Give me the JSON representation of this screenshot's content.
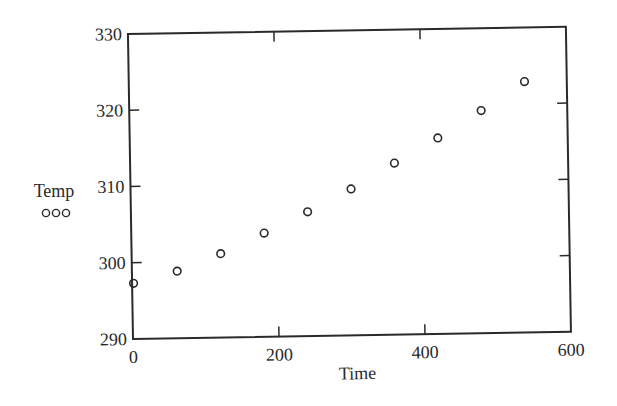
{
  "chart_data": {
    "type": "scatter",
    "title": "",
    "xlabel": "Time",
    "ylabel": "Temp",
    "xlim": [
      0,
      600
    ],
    "ylim": [
      290,
      330
    ],
    "xticks": [
      0,
      200,
      400,
      600
    ],
    "yticks": [
      290,
      300,
      310,
      320,
      330
    ],
    "xtick_labels": [
      "0",
      "200",
      "400",
      "600"
    ],
    "ytick_labels": [
      "290",
      "300",
      "310",
      "320",
      "330"
    ],
    "grid": false,
    "marker": "open-circle",
    "legend": {
      "label": "Temp",
      "marker_text": "ooo",
      "position": "left, under y-axis label"
    },
    "series": [
      {
        "name": "Temp",
        "x": [
          0,
          60,
          120,
          180,
          240,
          300,
          360,
          420,
          480,
          540
        ],
        "y": [
          297.3,
          298.8,
          301.0,
          303.6,
          306.3,
          309.2,
          312.5,
          315.7,
          319.2,
          322.9
        ]
      }
    ]
  },
  "labels": {
    "xlabel": "Time",
    "ylabel": "Temp",
    "legend_marker": "ooo"
  }
}
